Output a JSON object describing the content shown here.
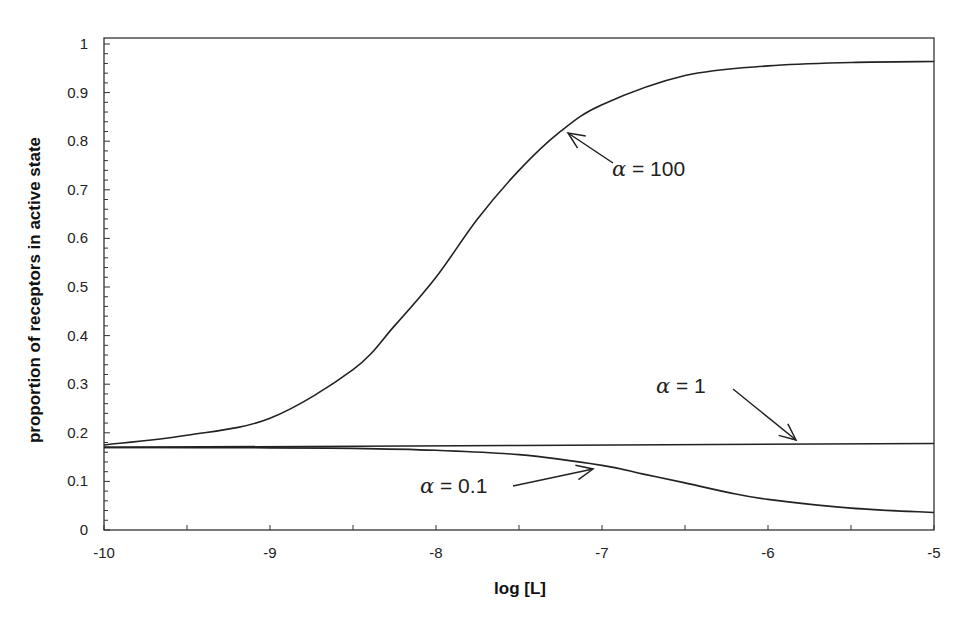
{
  "chart_data": {
    "type": "line",
    "title": "",
    "xlabel": "log [L]",
    "ylabel": "proportion of receptors in active state",
    "xlim": [
      -10,
      -5
    ],
    "ylim": [
      0,
      1
    ],
    "grid": false,
    "x_ticks": [
      "-10",
      "-9",
      "-8",
      "-7",
      "-6",
      "-5"
    ],
    "y_ticks": [
      "0",
      "0.1",
      "0.2",
      "0.3",
      "0.4",
      "0.5",
      "0.6",
      "0.7",
      "0.8",
      "0.9",
      "1"
    ],
    "series": [
      {
        "name": "α = 100",
        "x": [
          -10,
          -9.5,
          -9,
          -8.5,
          -8.25,
          -8,
          -7.75,
          -7.5,
          -7.25,
          -7,
          -6.5,
          -6,
          -5.5,
          -5
        ],
        "values": [
          0.175,
          0.195,
          0.23,
          0.33,
          0.42,
          0.52,
          0.64,
          0.74,
          0.82,
          0.875,
          0.935,
          0.955,
          0.962,
          0.964
        ]
      },
      {
        "name": "α = 1",
        "x": [
          -10,
          -5
        ],
        "values": [
          0.17,
          0.178
        ]
      },
      {
        "name": "α = 0.1",
        "x": [
          -10,
          -9,
          -8.5,
          -8,
          -7.5,
          -7,
          -6.75,
          -6.5,
          -6.25,
          -6,
          -5.5,
          -5
        ],
        "values": [
          0.17,
          0.169,
          0.168,
          0.164,
          0.155,
          0.133,
          0.115,
          0.097,
          0.078,
          0.063,
          0.045,
          0.036
        ]
      }
    ],
    "annotations": [
      {
        "label": "α = 100",
        "text_x": -7.0,
        "text_y": 0.8,
        "arrow_to_x": -7.22,
        "arrow_to_y": 0.83
      },
      {
        "label": "α = 1",
        "text_x": -6.78,
        "text_y": 0.215,
        "arrow_to_x": -5.85,
        "arrow_to_y": 0.178
      },
      {
        "label": "α = 0.1",
        "text_x": -7.9,
        "text_y": 0.1,
        "arrow_to_x": -7.05,
        "arrow_to_y": 0.128
      }
    ]
  },
  "labels": {
    "xlabel": "log [L]",
    "ylabel": "proportion of receptors in active state",
    "annot_100": "α = 100",
    "annot_1": "α = 1",
    "annot_01": "α = 0.1"
  },
  "colors": {
    "line": "#222222",
    "axis": "#333333",
    "background": "#ffffff"
  }
}
